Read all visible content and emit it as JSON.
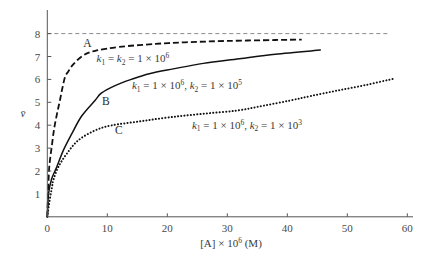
{
  "chart_data": {
    "type": "line",
    "title": "",
    "xlabel": "[A] × 10^6 (M)",
    "xlabel_parts": {
      "main": "[A] × 10",
      "sup": "6",
      "tail": " (M)"
    },
    "ylabel": "v̄",
    "xlim": [
      0,
      60
    ],
    "ylim": [
      0,
      8.6
    ],
    "xticks": [
      0,
      10,
      20,
      30,
      40,
      50,
      60
    ],
    "xtick_labels": [
      "0",
      "10",
      "20",
      "30",
      "40",
      "50",
      "60"
    ],
    "yticks": [
      1,
      2,
      3,
      4,
      5,
      6,
      7,
      8
    ],
    "ytick_labels": [
      "1",
      "2",
      "3",
      "4",
      "5",
      "6",
      "7",
      "8"
    ],
    "grid": false,
    "reference_line": {
      "y": 8,
      "x_range": [
        0,
        57
      ],
      "style": "dashed",
      "color": "#8a8a8a"
    },
    "series": [
      {
        "name": "A",
        "label": "k1 = k2 = 1 × 10^6",
        "style": "dashed",
        "color": "#111111",
        "points": [
          [
            0,
            0
          ],
          [
            0.1,
            0.8
          ],
          [
            0.28,
            2.0
          ],
          [
            0.5,
            2.6
          ],
          [
            0.73,
            3.04
          ],
          [
            1.0,
            3.6
          ],
          [
            1.28,
            4.06
          ],
          [
            1.7,
            4.6
          ],
          [
            2.1,
            5.08
          ],
          [
            2.5,
            5.6
          ],
          [
            2.95,
            6.1
          ],
          [
            3.5,
            6.35
          ],
          [
            4.4,
            6.68
          ],
          [
            6,
            7.05
          ],
          [
            8,
            7.25
          ],
          [
            12,
            7.42
          ],
          [
            18,
            7.55
          ],
          [
            23,
            7.62
          ],
          [
            30,
            7.68
          ],
          [
            38,
            7.72
          ],
          [
            42.4,
            7.74
          ]
        ]
      },
      {
        "name": "B",
        "label": "k1 = 1 × 10^6, k2 = 1 × 10^5",
        "style": "solid",
        "color": "#111111",
        "points": [
          [
            0,
            0
          ],
          [
            0.2,
            1.0
          ],
          [
            0.73,
            1.66
          ],
          [
            1.57,
            2.17
          ],
          [
            2.67,
            2.9
          ],
          [
            4.07,
            3.62
          ],
          [
            5.73,
            4.4
          ],
          [
            7.95,
            5.08
          ],
          [
            9,
            5.4
          ],
          [
            11.3,
            5.73
          ],
          [
            14,
            6.0
          ],
          [
            17,
            6.25
          ],
          [
            21,
            6.46
          ],
          [
            26,
            6.7
          ],
          [
            32,
            6.9
          ],
          [
            38,
            7.1
          ],
          [
            45.5,
            7.28
          ]
        ]
      },
      {
        "name": "C",
        "label": "k1 = 1 × 10^6, k2 = 1 × 10^3",
        "style": "dotted",
        "color": "#111111",
        "points": [
          [
            0,
            0
          ],
          [
            0.2,
            0.4
          ],
          [
            0.5,
            0.9
          ],
          [
            0.78,
            1.28
          ],
          [
            1.0,
            1.6
          ],
          [
            1.83,
            2.17
          ],
          [
            3.23,
            2.75
          ],
          [
            5.17,
            3.34
          ],
          [
            7.95,
            3.77
          ],
          [
            10.7,
            3.99
          ],
          [
            15.5,
            4.17
          ],
          [
            20.5,
            4.35
          ],
          [
            26,
            4.5
          ],
          [
            31.6,
            4.64
          ],
          [
            36,
            4.85
          ],
          [
            40.5,
            5.08
          ],
          [
            44,
            5.28
          ],
          [
            48.3,
            5.51
          ],
          [
            53,
            5.75
          ],
          [
            57.7,
            6.03
          ]
        ]
      }
    ],
    "annotations": [
      {
        "id": "A-letter",
        "text": "A",
        "x": 6.0,
        "y": 7.4
      },
      {
        "id": "B-letter",
        "text": "B",
        "x": 9.1,
        "y": 4.9
      },
      {
        "id": "C-letter",
        "text": "C",
        "x": 11.3,
        "y": 3.6
      },
      {
        "id": "A-params",
        "k1": "k",
        "k1_sub": "1",
        "mid": " = ",
        "k2": "k",
        "k2_sub": "2",
        "value": " = 1 × 10",
        "exp": "6",
        "x": 8.2,
        "y": 6.75
      },
      {
        "id": "B-params",
        "k1_sub": "1",
        "k1_value": " = 1 × 10",
        "k1_exp": "6",
        "k2_sub": "2",
        "k2_value": " = 1 × 10",
        "k2_exp": "5",
        "x": 14.1,
        "y": 5.58
      },
      {
        "id": "C-params",
        "k1_sub": "1",
        "k1_value": " = 1 × 10",
        "k1_exp": "6",
        "k2_sub": "2",
        "k2_value": " = 1 × 10",
        "k2_exp": "3",
        "x": 24.1,
        "y": 3.85
      }
    ]
  }
}
